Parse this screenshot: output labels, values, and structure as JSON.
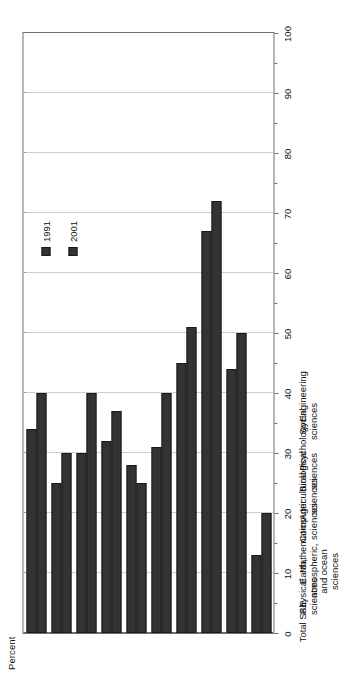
{
  "chart_data": {
    "type": "bar",
    "orientation": "horizontal",
    "title": "",
    "xlabel": "Percent",
    "ylabel": "",
    "xlim": [
      0,
      100
    ],
    "xticks": [
      0,
      10,
      20,
      30,
      40,
      50,
      60,
      70,
      80,
      90,
      100
    ],
    "xtick_labels": [
      "0",
      "10",
      "20",
      "30",
      "40",
      "50",
      "60",
      "70",
      "80",
      "90",
      "100"
    ],
    "grid": true,
    "grid_style": "dotted",
    "legend_position": "inside-upper-right",
    "categories": [
      "Total S&E",
      "Physical\nsciences",
      "Earth,\natmospheric,\nand ocean\nsciences",
      "Mathematics",
      "Computer\nsciences",
      "Agricultural\nsciences",
      "Biological\nsciences",
      "Psychology",
      "Social\nsciences",
      "Engineering"
    ],
    "series": [
      {
        "name": "1991",
        "color": "#333333",
        "values": [
          34,
          25,
          30,
          32,
          28,
          31,
          45,
          67,
          44,
          13
        ]
      },
      {
        "name": "2001",
        "color": "#333333",
        "values": [
          40,
          30,
          40,
          37,
          25,
          40,
          51,
          72,
          50,
          20
        ]
      }
    ]
  },
  "legend": {
    "items": [
      {
        "label": "1991",
        "swatch": "legend-swatch-1991"
      },
      {
        "label": "2001",
        "swatch": "legend-swatch-2001"
      }
    ]
  },
  "axis": {
    "percent_label": "Percent"
  }
}
